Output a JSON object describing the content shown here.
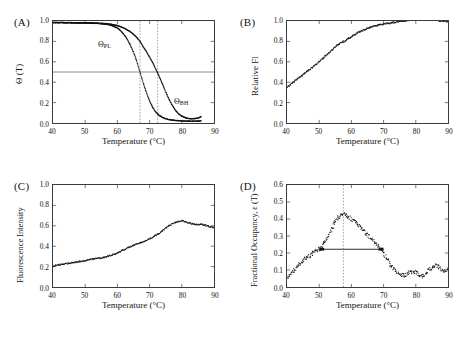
{
  "figure": {
    "panels": [
      {
        "label": "(A)",
        "xlabel": "Temperature (°C)",
        "ylabel": "Θ (T)",
        "xticks": [
          "40",
          "50",
          "60",
          "70",
          "80",
          "90"
        ],
        "yticks": [
          "0.0",
          "0.2",
          "0.4",
          "0.6",
          "0.8",
          "1.0"
        ],
        "annotations": [
          {
            "name": "curve-label-theta-pl",
            "text": "Θ",
            "subscript": "PL"
          },
          {
            "name": "curve-label-theta-bh",
            "text": "Θ",
            "subscript": "BH"
          }
        ]
      },
      {
        "label": "(B)",
        "xlabel": "Temperature (°C)",
        "ylabel": "Relative Fl",
        "xticks": [
          "40",
          "50",
          "60",
          "70",
          "80",
          "90"
        ],
        "yticks": [
          "0.0",
          "0.2",
          "0.4",
          "0.6",
          "0.8",
          "1.0"
        ]
      },
      {
        "label": "(C)",
        "xlabel": "Temperature (°C)",
        "ylabel": "Fluorescence Intensity",
        "xticks": [
          "40",
          "50",
          "60",
          "70",
          "80",
          "90"
        ],
        "yticks": [
          "0.0",
          "0.2",
          "0.4",
          "0.6",
          "0.8",
          "1.0"
        ]
      },
      {
        "label": "(D)",
        "xlabel": "Temperature (°C)",
        "ylabel": "Fractional Occupancy, ε (T)",
        "xticks": [
          "40",
          "50",
          "60",
          "70",
          "80",
          "90"
        ],
        "yticks": [
          "0.0",
          "0.1",
          "0.2",
          "0.3",
          "0.4",
          "0.5",
          "0.6"
        ]
      }
    ]
  },
  "chart_data": [
    {
      "panel": "(A)",
      "type": "line",
      "title": "",
      "xlabel": "Temperature (°C)",
      "ylabel": "Θ (T)",
      "xlim": [
        40,
        90
      ],
      "ylim": [
        0.0,
        1.0
      ],
      "xticks": [
        40,
        50,
        60,
        70,
        80,
        90
      ],
      "yticks": [
        0.0,
        0.2,
        0.4,
        0.6,
        0.8,
        1.0
      ],
      "grid": false,
      "legend": "in-plot curve labels",
      "reference_lines": [
        {
          "name": "half-occupancy",
          "orientation": "horizontal",
          "value": 0.5,
          "style": "solid"
        },
        {
          "name": "tm-theta-pl",
          "orientation": "vertical",
          "value": 67.0,
          "style": "dotted"
        },
        {
          "name": "tm-theta-bh",
          "orientation": "vertical",
          "value": 72.5,
          "style": "dotted"
        }
      ],
      "series": [
        {
          "name": "Θ PL",
          "label": "Θ_PL",
          "midpoint": 67.0,
          "x": [
            40,
            42,
            44,
            46,
            48,
            50,
            52,
            54,
            56,
            58,
            60,
            61,
            62,
            63,
            64,
            65,
            66,
            67,
            68,
            69,
            70,
            71,
            72,
            73,
            74,
            75,
            76,
            78,
            80,
            82,
            84,
            86
          ],
          "values": [
            0.985,
            0.985,
            0.984,
            0.983,
            0.982,
            0.981,
            0.979,
            0.976,
            0.97,
            0.96,
            0.93,
            0.905,
            0.87,
            0.825,
            0.765,
            0.695,
            0.605,
            0.5,
            0.395,
            0.3,
            0.215,
            0.15,
            0.105,
            0.075,
            0.055,
            0.042,
            0.034,
            0.025,
            0.02,
            0.018,
            0.018,
            0.02
          ]
        },
        {
          "name": "Θ BH",
          "label": "Θ_BH",
          "midpoint": 72.5,
          "x": [
            40,
            44,
            48,
            52,
            56,
            58,
            60,
            62,
            64,
            65,
            66,
            67,
            68,
            69,
            70,
            71,
            72,
            73,
            74,
            75,
            76,
            77,
            78,
            79,
            80,
            81,
            82,
            83,
            84,
            85,
            86
          ],
          "values": [
            0.985,
            0.984,
            0.983,
            0.981,
            0.975,
            0.968,
            0.955,
            0.932,
            0.895,
            0.87,
            0.84,
            0.8,
            0.75,
            0.7,
            0.645,
            0.59,
            0.525,
            0.455,
            0.38,
            0.305,
            0.235,
            0.175,
            0.125,
            0.09,
            0.068,
            0.053,
            0.045,
            0.042,
            0.043,
            0.048,
            0.062
          ]
        }
      ]
    },
    {
      "panel": "(B)",
      "type": "scatter",
      "title": "",
      "xlabel": "Temperature (°C)",
      "ylabel": "Relative Fl",
      "xlim": [
        40,
        90
      ],
      "ylim": [
        0.0,
        1.0
      ],
      "xticks": [
        40,
        50,
        60,
        70,
        80,
        90
      ],
      "yticks": [
        0.0,
        0.2,
        0.4,
        0.6,
        0.8,
        1.0
      ],
      "grid": false,
      "series": [
        {
          "name": "Relative fluorescence",
          "x": [
            40,
            41,
            42,
            43,
            44,
            45,
            46,
            47,
            48,
            49,
            50,
            51,
            52,
            53,
            54,
            55,
            56,
            57,
            58,
            59,
            60,
            61,
            62,
            63,
            64,
            65,
            66,
            67,
            68,
            69,
            70,
            71,
            72,
            73,
            74,
            75,
            76,
            77,
            78,
            79,
            80,
            81,
            82,
            83,
            84,
            85,
            86,
            87,
            88,
            89,
            90
          ],
          "values": [
            0.35,
            0.375,
            0.4,
            0.425,
            0.45,
            0.475,
            0.5,
            0.525,
            0.55,
            0.575,
            0.6,
            0.63,
            0.66,
            0.69,
            0.715,
            0.745,
            0.775,
            0.79,
            0.805,
            0.825,
            0.845,
            0.865,
            0.885,
            0.9,
            0.915,
            0.93,
            0.94,
            0.95,
            0.955,
            0.965,
            0.97,
            0.975,
            0.98,
            0.985,
            0.99,
            0.995,
            1.0,
            1.005,
            1.01,
            1.015,
            1.015,
            1.02,
            1.02,
            1.02,
            1.015,
            1.015,
            1.01,
            1.005,
            1.0,
            1.0,
            0.995
          ]
        }
      ]
    },
    {
      "panel": "(C)",
      "type": "scatter",
      "title": "",
      "xlabel": "Temperature (°C)",
      "ylabel": "Fluorescence Intensity",
      "xlim": [
        40,
        90
      ],
      "ylim": [
        0.0,
        1.0
      ],
      "xticks": [
        40,
        50,
        60,
        70,
        80,
        90
      ],
      "yticks": [
        0.0,
        0.2,
        0.4,
        0.6,
        0.8,
        1.0
      ],
      "grid": false,
      "series": [
        {
          "name": "Fluorescence intensity",
          "x": [
            40,
            41,
            42,
            43,
            44,
            45,
            46,
            47,
            48,
            49,
            50,
            51,
            52,
            53,
            54,
            55,
            56,
            57,
            58,
            59,
            60,
            61,
            62,
            63,
            64,
            65,
            66,
            67,
            68,
            69,
            70,
            71,
            72,
            73,
            74,
            75,
            76,
            77,
            78,
            79,
            80,
            81,
            82,
            83,
            84,
            85,
            86,
            87,
            88,
            89,
            90
          ],
          "values": [
            0.205,
            0.212,
            0.218,
            0.223,
            0.228,
            0.232,
            0.238,
            0.243,
            0.248,
            0.252,
            0.258,
            0.266,
            0.272,
            0.276,
            0.28,
            0.286,
            0.292,
            0.3,
            0.31,
            0.322,
            0.335,
            0.35,
            0.365,
            0.38,
            0.395,
            0.408,
            0.42,
            0.432,
            0.445,
            0.458,
            0.472,
            0.49,
            0.508,
            0.528,
            0.552,
            0.578,
            0.6,
            0.618,
            0.632,
            0.642,
            0.65,
            0.645,
            0.632,
            0.622,
            0.615,
            0.612,
            0.614,
            0.61,
            0.6,
            0.59,
            0.582
          ]
        }
      ]
    },
    {
      "panel": "(D)",
      "type": "scatter",
      "title": "",
      "xlabel": "Temperature (°C)",
      "ylabel": "Fractional Occupancy, ε (T)",
      "xlim": [
        40,
        90
      ],
      "ylim": [
        0.0,
        0.6
      ],
      "xticks": [
        40,
        50,
        60,
        70,
        80,
        90
      ],
      "yticks": [
        0.0,
        0.1,
        0.2,
        0.3,
        0.4,
        0.5,
        0.6
      ],
      "grid": false,
      "reference_lines": [
        {
          "name": "peak-temperature",
          "orientation": "vertical",
          "value": 57.5,
          "style": "dotted"
        }
      ],
      "annotations": [
        {
          "name": "width-marker",
          "type": "double-arrow",
          "y": 0.222,
          "x_start": 50.5,
          "x_end": 69.5
        }
      ],
      "peak": {
        "x": 57.5,
        "y": 0.43
      },
      "series": [
        {
          "name": "Fractional occupancy",
          "x": [
            40,
            41,
            42,
            43,
            44,
            45,
            46,
            47,
            48,
            49,
            50,
            51,
            52,
            53,
            54,
            55,
            56,
            57,
            58,
            59,
            60,
            61,
            62,
            63,
            64,
            65,
            66,
            67,
            68,
            69,
            70,
            71,
            72,
            73,
            74,
            75,
            76,
            77,
            78,
            79,
            80,
            81,
            82,
            83,
            84,
            85,
            86,
            87,
            88,
            89,
            90
          ],
          "values": [
            0.055,
            0.075,
            0.095,
            0.115,
            0.135,
            0.155,
            0.17,
            0.185,
            0.2,
            0.212,
            0.222,
            0.24,
            0.27,
            0.305,
            0.345,
            0.385,
            0.41,
            0.43,
            0.425,
            0.415,
            0.4,
            0.385,
            0.368,
            0.35,
            0.33,
            0.31,
            0.29,
            0.268,
            0.245,
            0.222,
            0.195,
            0.165,
            0.135,
            0.11,
            0.09,
            0.075,
            0.068,
            0.072,
            0.085,
            0.095,
            0.088,
            0.07,
            0.062,
            0.075,
            0.098,
            0.118,
            0.128,
            0.12,
            0.105,
            0.098,
            0.11
          ]
        }
      ]
    }
  ]
}
